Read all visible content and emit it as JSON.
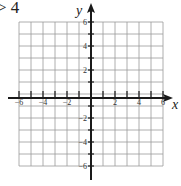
{
  "prompt": {
    "text": "> 4"
  },
  "graph": {
    "x_axis_label": "x",
    "y_axis_label": "y",
    "x_range": [
      -6,
      6
    ],
    "y_range": [
      -6,
      6
    ],
    "grid_step": 1,
    "x_tick_labels": [
      "-6",
      "-4",
      "-2",
      "2",
      "4",
      "6"
    ],
    "y_tick_labels": [
      "6",
      "4",
      "2",
      "-2",
      "-4",
      "-6"
    ],
    "colors": {
      "grid": "#9a9a9a",
      "axis": "#1a1a1a",
      "background": "#ffffff"
    }
  }
}
